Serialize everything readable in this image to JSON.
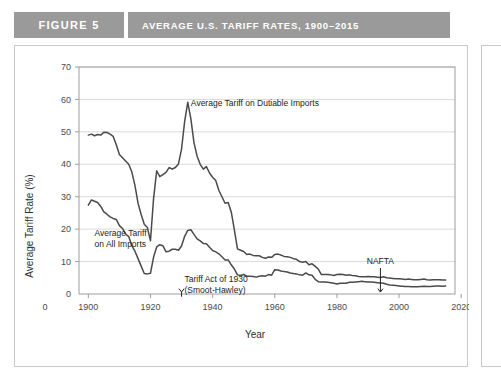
{
  "header": {
    "figure_number": "FIGURE 5",
    "title": "AVERAGE U.S. TARIFF RATES, 1900–2015",
    "band_color": "#9a9a9a",
    "band_text_color": "#ffffff"
  },
  "chart_data": {
    "type": "line",
    "title": "AVERAGE U.S. TARIFF RATES, 1900–2015",
    "xlabel": "Year",
    "ylabel": "Average Tariff Rate (%)",
    "xlim": [
      1897,
      2018
    ],
    "ylim": [
      0,
      70
    ],
    "grid": true,
    "grid_axis": "y",
    "legend_position": "inline-annotations",
    "x_tick_labels": [
      "0",
      "1900",
      "1920",
      "1940",
      "1960",
      "1980",
      "2000",
      "2020"
    ],
    "x_ticks": [
      1900,
      1920,
      1940,
      1960,
      1980,
      2000,
      2020
    ],
    "y_ticks": [
      0,
      10,
      20,
      30,
      40,
      50,
      60,
      70
    ],
    "line_color": "#4a4a4a",
    "series": [
      {
        "name": "Average Tariff on Dutiable Imports",
        "x": [
          1900,
          1901,
          1902,
          1903,
          1904,
          1905,
          1906,
          1907,
          1908,
          1909,
          1910,
          1911,
          1912,
          1913,
          1914,
          1915,
          1916,
          1917,
          1918,
          1919,
          1920,
          1921,
          1922,
          1923,
          1924,
          1925,
          1926,
          1927,
          1928,
          1929,
          1930,
          1931,
          1932,
          1933,
          1934,
          1935,
          1936,
          1937,
          1938,
          1939,
          1940,
          1941,
          1942,
          1943,
          1944,
          1945,
          1946,
          1947,
          1948,
          1949,
          1950,
          1951,
          1952,
          1953,
          1954,
          1955,
          1956,
          1957,
          1958,
          1959,
          1960,
          1961,
          1962,
          1963,
          1964,
          1965,
          1966,
          1967,
          1968,
          1969,
          1970,
          1971,
          1972,
          1973,
          1974,
          1975,
          1976,
          1977,
          1978,
          1979,
          1980,
          1981,
          1982,
          1983,
          1984,
          1985,
          1986,
          1987,
          1988,
          1989,
          1990,
          1991,
          1992,
          1993,
          1994,
          1995,
          1996,
          1997,
          1998,
          1999,
          2000,
          2001,
          2002,
          2003,
          2004,
          2005,
          2006,
          2007,
          2008,
          2009,
          2010,
          2011,
          2012,
          2013,
          2014,
          2015
        ],
        "values": [
          49.0,
          49.3,
          48.8,
          49.2,
          49.0,
          49.9,
          49.8,
          49.3,
          48.6,
          46.0,
          43.0,
          42.0,
          41.0,
          40.0,
          37.6,
          33.5,
          28.0,
          24.5,
          21.5,
          20.5,
          16.4,
          29.5,
          38.0,
          36.2,
          36.8,
          37.5,
          39.0,
          38.5,
          39.0,
          40.1,
          44.7,
          53.2,
          59.1,
          54.0,
          46.7,
          42.5,
          40.0,
          38.5,
          39.3,
          37.3,
          36.0,
          35.0,
          32.0,
          30.0,
          28.0,
          28.2,
          25.3,
          19.8,
          13.9,
          13.5,
          13.1,
          12.2,
          12.3,
          11.9,
          11.8,
          11.8,
          11.3,
          11.0,
          11.4,
          11.3,
          12.2,
          12.3,
          12.0,
          11.6,
          11.5,
          11.3,
          10.9,
          10.7,
          10.0,
          9.8,
          10.0,
          9.0,
          9.3,
          8.5,
          7.7,
          6.0,
          6.0,
          6.0,
          5.9,
          5.7,
          6.0,
          6.1,
          6.0,
          5.8,
          5.9,
          5.7,
          5.6,
          5.4,
          5.3,
          5.3,
          5.4,
          5.3,
          5.3,
          5.2,
          5.1,
          5.3,
          5.0,
          4.9,
          4.8,
          4.7,
          4.7,
          4.6,
          4.5,
          4.6,
          4.5,
          4.4,
          4.4,
          4.5,
          4.6,
          4.4,
          4.3,
          4.4,
          4.4,
          4.4,
          4.3,
          4.3
        ],
        "annotation": {
          "text": "Average Tariff on Dutiable Imports",
          "x": 1933,
          "y": 58
        }
      },
      {
        "name": "Average Tariff on All Imports",
        "x": [
          1900,
          1901,
          1902,
          1903,
          1904,
          1905,
          1906,
          1907,
          1908,
          1909,
          1910,
          1911,
          1912,
          1913,
          1914,
          1915,
          1916,
          1917,
          1918,
          1919,
          1920,
          1921,
          1922,
          1923,
          1924,
          1925,
          1926,
          1927,
          1928,
          1929,
          1930,
          1931,
          1932,
          1933,
          1934,
          1935,
          1936,
          1937,
          1938,
          1939,
          1940,
          1941,
          1942,
          1943,
          1944,
          1945,
          1946,
          1947,
          1948,
          1949,
          1950,
          1951,
          1952,
          1953,
          1954,
          1955,
          1956,
          1957,
          1958,
          1959,
          1960,
          1961,
          1962,
          1963,
          1964,
          1965,
          1966,
          1967,
          1968,
          1969,
          1970,
          1971,
          1972,
          1973,
          1974,
          1975,
          1976,
          1977,
          1978,
          1979,
          1980,
          1981,
          1982,
          1983,
          1984,
          1985,
          1986,
          1987,
          1988,
          1989,
          1990,
          1991,
          1992,
          1993,
          1994,
          1995,
          1996,
          1997,
          1998,
          1999,
          2000,
          2001,
          2002,
          2003,
          2004,
          2005,
          2006,
          2007,
          2008,
          2009,
          2010,
          2011,
          2012,
          2013,
          2014,
          2015
        ],
        "values": [
          27.4,
          29.0,
          28.6,
          28.2,
          27.0,
          25.3,
          24.6,
          23.8,
          23.3,
          23.0,
          21.1,
          20.2,
          18.5,
          17.7,
          14.9,
          13.2,
          10.9,
          8.6,
          6.3,
          6.2,
          6.4,
          11.4,
          14.5,
          15.2,
          14.9,
          13.0,
          13.2,
          13.8,
          13.8,
          13.5,
          14.8,
          17.8,
          19.6,
          19.8,
          18.4,
          17.0,
          16.4,
          15.6,
          15.5,
          14.4,
          13.4,
          13.0,
          12.4,
          11.5,
          10.5,
          10.5,
          9.0,
          7.7,
          5.9,
          5.7,
          6.0,
          5.5,
          5.5,
          5.4,
          5.2,
          5.5,
          5.6,
          5.5,
          6.0,
          5.8,
          7.5,
          7.4,
          7.1,
          6.9,
          6.8,
          6.5,
          6.3,
          6.2,
          5.9,
          5.8,
          6.5,
          5.9,
          5.8,
          4.5,
          3.8,
          3.7,
          3.7,
          3.6,
          3.5,
          3.3,
          3.1,
          3.3,
          3.3,
          3.3,
          3.6,
          3.6,
          3.7,
          3.8,
          3.9,
          3.8,
          3.7,
          3.7,
          3.6,
          3.5,
          3.4,
          3.3,
          3.0,
          2.8,
          2.7,
          2.6,
          2.5,
          2.4,
          2.3,
          2.3,
          2.2,
          2.2,
          2.2,
          2.3,
          2.4,
          2.3,
          2.3,
          2.4,
          2.5,
          2.5,
          2.4,
          2.5
        ],
        "annotation": {
          "text_line1": "Average Tariff",
          "text_line2": "on All Imports",
          "x": 1902,
          "y": 18
        }
      }
    ],
    "annotations": [
      {
        "name": "smoot-hawley",
        "text_line1": "Tariff Act of 1930",
        "text_line2": "(Smoot-Hawley)",
        "arrow_x": 1930,
        "arrow_from_y": 4.4,
        "arrow_to_y": 0.6
      },
      {
        "name": "nafta",
        "text_line1": "NAFTA",
        "arrow_x": 1994,
        "arrow_from_y": 8.0,
        "arrow_to_y": 0.6
      }
    ]
  }
}
